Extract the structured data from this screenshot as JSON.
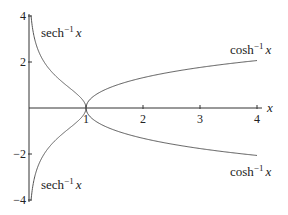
{
  "chart_data": {
    "type": "line",
    "title": "",
    "xlabel": "x",
    "ylabel": "",
    "xlim": [
      0,
      4
    ],
    "ylim": [
      -4,
      4
    ],
    "grid": false,
    "legend": "none",
    "x_ticks": [
      1,
      2,
      3,
      4
    ],
    "x_tick_labels": [
      "1",
      "2",
      "3",
      "4"
    ],
    "y_ticks": [
      -4,
      -2,
      2,
      4
    ],
    "y_tick_labels": [
      "−4",
      "−2",
      "2",
      "4"
    ],
    "series": [
      {
        "name": "sech⁻¹ x (upper)",
        "function": "asech",
        "branch": "positive",
        "domain": [
          0,
          1
        ],
        "x": [
          0.04,
          0.05,
          0.1,
          0.2,
          0.3,
          0.4,
          0.5,
          0.6,
          0.7,
          0.8,
          0.9,
          1.0
        ],
        "values": [
          3.91,
          3.69,
          2.99,
          2.29,
          1.87,
          1.57,
          1.32,
          1.1,
          0.9,
          0.69,
          0.47,
          0.0
        ]
      },
      {
        "name": "sech⁻¹ x (lower)",
        "function": "asech",
        "branch": "negative",
        "domain": [
          0,
          1
        ],
        "x": [
          0.04,
          0.05,
          0.1,
          0.2,
          0.3,
          0.4,
          0.5,
          0.6,
          0.7,
          0.8,
          0.9,
          1.0
        ],
        "values": [
          -3.91,
          -3.69,
          -2.99,
          -2.29,
          -1.87,
          -1.57,
          -1.32,
          -1.1,
          -0.9,
          -0.69,
          -0.47,
          0.0
        ]
      },
      {
        "name": "cosh⁻¹ x (upper)",
        "function": "acosh",
        "branch": "positive",
        "domain": [
          1,
          4
        ],
        "x": [
          1.0,
          1.1,
          1.25,
          1.5,
          2.0,
          2.5,
          3.0,
          3.5,
          4.0
        ],
        "values": [
          0.0,
          0.44,
          0.69,
          0.96,
          1.32,
          1.57,
          1.76,
          1.92,
          2.06
        ]
      },
      {
        "name": "cosh⁻¹ x (lower)",
        "function": "acosh",
        "branch": "negative",
        "domain": [
          1,
          4
        ],
        "x": [
          1.0,
          1.1,
          1.25,
          1.5,
          2.0,
          2.5,
          3.0,
          3.5,
          4.0
        ],
        "values": [
          0.0,
          -0.44,
          -0.69,
          -0.96,
          -1.32,
          -1.57,
          -1.76,
          -1.92,
          -2.06
        ]
      }
    ],
    "annotations": [
      {
        "text": "sech⁻¹ x",
        "position": "upper-left"
      },
      {
        "text": "cosh⁻¹ x",
        "position": "upper-right"
      },
      {
        "text": "sech⁻¹ x",
        "position": "lower-left"
      },
      {
        "text": "cosh⁻¹ x",
        "position": "lower-right"
      }
    ]
  },
  "labels": {
    "sech_base": "sech",
    "cosh_base": "cosh",
    "inverse_sup": "−1",
    "var": "x",
    "x_axis": "x"
  },
  "style": {
    "curve_color": "#555555",
    "axis_color": "#333333"
  }
}
